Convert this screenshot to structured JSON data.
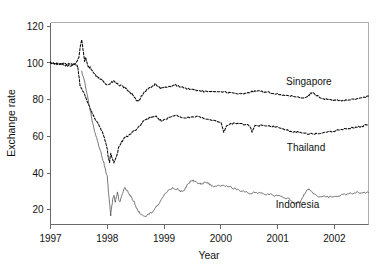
{
  "chart_data": {
    "type": "line",
    "title": "",
    "xlabel": "Year",
    "ylabel": "Exchange rate",
    "xlim": [
      1997.0,
      2002.6
    ],
    "ylim": [
      12,
      122
    ],
    "xticks": [
      1997,
      1998,
      1999,
      2000,
      2001,
      2002
    ],
    "xtick_labels": [
      "1997",
      "1998",
      "1999",
      "2000",
      "2001",
      "2002"
    ],
    "yticks": [
      20,
      40,
      60,
      80,
      100,
      120
    ],
    "ytick_labels": [
      "20",
      "40",
      "60",
      "80",
      "100",
      "120"
    ],
    "grid": false,
    "legend_position": "inline-annotations",
    "note": "Index of currency value, January 1997 = 100. Asian financial crisis.",
    "series": [
      {
        "name": "Singapore",
        "label": "Singapore",
        "color": "#0b0b0b",
        "style": "dashed-dense",
        "label_x": 2001.55,
        "label_y": 88,
        "x": [
          1997.0,
          1997.05,
          1997.1,
          1997.15,
          1997.2,
          1997.25,
          1997.3,
          1997.35,
          1997.4,
          1997.45,
          1997.5,
          1997.52,
          1997.55,
          1997.58,
          1997.6,
          1997.62,
          1997.65,
          1997.68,
          1997.7,
          1997.73,
          1997.76,
          1997.8,
          1997.84,
          1997.88,
          1997.92,
          1997.96,
          1998.0,
          1998.04,
          1998.08,
          1998.12,
          1998.16,
          1998.2,
          1998.25,
          1998.3,
          1998.35,
          1998.4,
          1998.45,
          1998.5,
          1998.55,
          1998.6,
          1998.65,
          1998.7,
          1998.75,
          1998.8,
          1998.85,
          1998.9,
          1998.95,
          1999.0,
          1999.1,
          1999.2,
          1999.3,
          1999.4,
          1999.5,
          1999.6,
          1999.7,
          1999.8,
          1999.9,
          2000.0,
          2000.1,
          2000.2,
          2000.3,
          2000.4,
          2000.5,
          2000.6,
          2000.7,
          2000.8,
          2000.9,
          2001.0,
          2001.1,
          2001.2,
          2001.3,
          2001.4,
          2001.5,
          2001.55,
          2001.6,
          2001.7,
          2001.8,
          2001.9,
          2002.0,
          2002.1,
          2002.2,
          2002.3,
          2002.4,
          2002.5,
          2002.6
        ],
        "y": [
          100.0,
          99.8,
          99.5,
          99.3,
          99.0,
          98.7,
          98.5,
          98.2,
          99.0,
          100.0,
          103.0,
          108.0,
          112.5,
          106.0,
          101.0,
          103.0,
          99.0,
          97.0,
          97.5,
          96.0,
          94.5,
          93.0,
          92.0,
          91.0,
          90.5,
          89.0,
          88.0,
          88.5,
          89.5,
          90.0,
          89.0,
          88.0,
          87.5,
          86.5,
          85.5,
          84.0,
          82.5,
          80.0,
          79.0,
          82.0,
          84.0,
          85.5,
          86.5,
          87.5,
          88.5,
          87.0,
          86.0,
          86.5,
          87.0,
          88.0,
          87.0,
          86.0,
          85.5,
          85.0,
          84.5,
          84.0,
          84.5,
          84.5,
          84.0,
          83.5,
          83.0,
          83.5,
          84.0,
          84.5,
          84.5,
          84.0,
          83.5,
          83.0,
          82.5,
          82.0,
          81.5,
          81.0,
          81.0,
          82.5,
          84.0,
          82.0,
          80.5,
          80.0,
          79.5,
          79.5,
          79.5,
          80.0,
          80.5,
          81.0,
          82.0
        ]
      },
      {
        "name": "Thailand",
        "label": "Thailand",
        "color": "#0b0b0b",
        "style": "dashed-dense",
        "label_x": 2001.5,
        "label_y": 52,
        "x": [
          1997.0,
          1997.05,
          1997.1,
          1997.15,
          1997.2,
          1997.25,
          1997.3,
          1997.35,
          1997.4,
          1997.45,
          1997.48,
          1997.5,
          1997.52,
          1997.55,
          1997.58,
          1997.6,
          1997.62,
          1997.65,
          1997.68,
          1997.7,
          1997.73,
          1997.76,
          1997.8,
          1997.84,
          1997.88,
          1997.92,
          1997.96,
          1998.0,
          1998.02,
          1998.04,
          1998.06,
          1998.08,
          1998.1,
          1998.12,
          1998.15,
          1998.18,
          1998.2,
          1998.25,
          1998.3,
          1998.35,
          1998.4,
          1998.45,
          1998.5,
          1998.55,
          1998.6,
          1998.65,
          1998.7,
          1998.75,
          1998.8,
          1998.85,
          1998.9,
          1998.95,
          1999.0,
          1999.1,
          1999.2,
          1999.3,
          1999.4,
          1999.5,
          1999.6,
          1999.7,
          1999.8,
          1999.9,
          2000.0,
          2000.05,
          2000.1,
          2000.2,
          2000.3,
          2000.4,
          2000.5,
          2000.55,
          2000.6,
          2000.7,
          2000.8,
          2000.9,
          2001.0,
          2001.1,
          2001.2,
          2001.3,
          2001.4,
          2001.5,
          2001.6,
          2001.7,
          2001.8,
          2001.9,
          2002.0,
          2002.1,
          2002.2,
          2002.3,
          2002.4,
          2002.5,
          2002.6
        ],
        "y": [
          100.0,
          99.9,
          99.8,
          99.7,
          99.6,
          99.5,
          99.4,
          99.3,
          99.2,
          99.0,
          98.0,
          93.0,
          88.0,
          86.0,
          84.0,
          83.0,
          81.0,
          79.0,
          77.0,
          75.0,
          73.0,
          71.0,
          69.0,
          67.0,
          64.0,
          62.0,
          58.0,
          53.0,
          48.0,
          46.0,
          51.0,
          49.0,
          47.0,
          45.5,
          48.0,
          51.0,
          54.0,
          57.0,
          59.0,
          60.0,
          61.0,
          62.5,
          63.5,
          65.0,
          67.0,
          68.5,
          69.5,
          70.0,
          70.5,
          71.0,
          69.5,
          68.5,
          69.0,
          70.5,
          71.5,
          70.5,
          70.0,
          70.5,
          71.0,
          70.0,
          69.0,
          68.5,
          68.0,
          62.0,
          66.0,
          67.0,
          67.0,
          66.5,
          66.0,
          62.5,
          65.5,
          66.0,
          66.0,
          65.5,
          65.0,
          64.0,
          63.0,
          62.5,
          62.0,
          61.5,
          61.5,
          61.5,
          62.0,
          62.5,
          63.0,
          63.5,
          64.0,
          64.5,
          65.0,
          65.5,
          66.5
        ]
      },
      {
        "name": "Indonesia",
        "label": "Indonesia",
        "color": "#4c4c4c",
        "style": "solid-thin",
        "label_x": 2001.35,
        "label_y": 21,
        "x": [
          1997.55,
          1997.6,
          1997.65,
          1997.7,
          1997.75,
          1997.8,
          1997.85,
          1997.9,
          1997.95,
          1998.0,
          1998.02,
          1998.04,
          1998.06,
          1998.08,
          1998.1,
          1998.12,
          1998.14,
          1998.16,
          1998.18,
          1998.2,
          1998.22,
          1998.25,
          1998.28,
          1998.3,
          1998.33,
          1998.36,
          1998.4,
          1998.44,
          1998.48,
          1998.5,
          1998.55,
          1998.6,
          1998.65,
          1998.7,
          1998.75,
          1998.8,
          1998.85,
          1998.9,
          1998.95,
          1999.0,
          1999.05,
          1999.1,
          1999.15,
          1999.2,
          1999.25,
          1999.3,
          1999.35,
          1999.4,
          1999.45,
          1999.5,
          1999.55,
          1999.6,
          1999.65,
          1999.7,
          1999.75,
          1999.8,
          1999.85,
          1999.9,
          1999.95,
          2000.0,
          2000.1,
          2000.2,
          2000.3,
          2000.4,
          2000.5,
          2000.6,
          2000.7,
          2000.8,
          2000.9,
          2001.0,
          2001.1,
          2001.2,
          2001.3,
          2001.35,
          2001.4,
          2001.45,
          2001.5,
          2001.55,
          2001.6,
          2001.7,
          2001.8,
          2001.9,
          2002.0,
          2002.1,
          2002.2,
          2002.3,
          2002.4,
          2002.5,
          2002.6
        ],
        "y": [
          95.0,
          90.0,
          82.0,
          74.0,
          66.0,
          60.0,
          55.0,
          50.0,
          44.0,
          38.0,
          30.0,
          24.0,
          17.0,
          22.0,
          26.0,
          28.0,
          24.0,
          27.0,
          30.0,
          26.0,
          24.0,
          27.0,
          30.0,
          32.0,
          31.0,
          30.0,
          28.0,
          26.0,
          24.0,
          22.0,
          19.0,
          17.5,
          16.5,
          17.0,
          18.0,
          19.0,
          21.0,
          23.0,
          26.0,
          28.0,
          30.0,
          31.0,
          32.0,
          31.5,
          31.0,
          30.0,
          30.5,
          33.0,
          35.0,
          36.0,
          35.5,
          34.5,
          34.0,
          34.5,
          35.0,
          34.0,
          33.0,
          32.5,
          33.0,
          33.5,
          33.0,
          32.0,
          31.0,
          30.0,
          29.0,
          29.5,
          29.0,
          28.5,
          28.0,
          27.5,
          27.0,
          26.0,
          23.5,
          24.0,
          24.0,
          27.5,
          30.0,
          31.0,
          30.0,
          27.5,
          27.0,
          27.0,
          27.5,
          28.0,
          28.5,
          29.0,
          29.5,
          29.0,
          29.5
        ]
      }
    ]
  },
  "axes": {
    "ylabel": "Exchange rate",
    "xlabel": "Year"
  }
}
